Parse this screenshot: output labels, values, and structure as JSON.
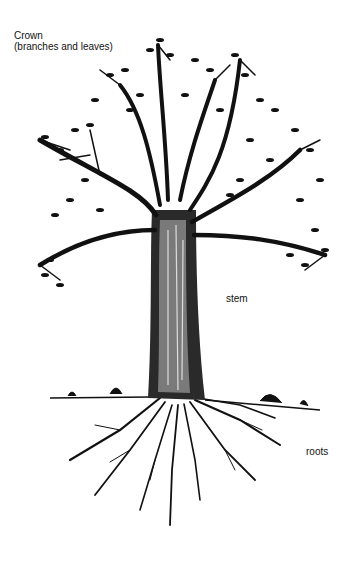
{
  "diagram": {
    "type": "labeled-illustration",
    "labels": {
      "crown_title": "Crown",
      "crown_subtitle": "(branches and leaves)",
      "stem": "stem",
      "roots": "roots"
    }
  }
}
